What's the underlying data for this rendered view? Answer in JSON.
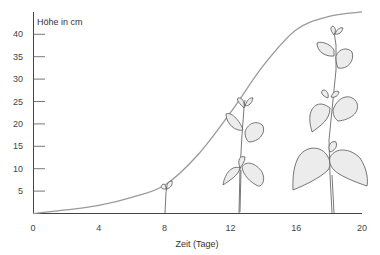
{
  "chart_data": {
    "type": "line",
    "title": "",
    "xlabel": "Zeit (Tage)",
    "ylabel": "Höhe in cm",
    "xlim": [
      0,
      20
    ],
    "ylim": [
      0,
      45
    ],
    "x_ticks": [
      0,
      4,
      8,
      12,
      16,
      20
    ],
    "y_ticks": [
      5,
      10,
      15,
      20,
      25,
      30,
      35,
      40
    ],
    "grid": false,
    "legend": null,
    "series": [
      {
        "name": "Wachstumskurve",
        "x": [
          0,
          2,
          4,
          6,
          8,
          10,
          12,
          14,
          16,
          18,
          20
        ],
        "y": [
          0,
          0.8,
          1.8,
          3.6,
          6.3,
          13,
          22.5,
          33,
          41,
          44,
          45
        ],
        "color": "#9a9a9a"
      }
    ],
    "annotations": [
      {
        "type": "illustration",
        "label": "Bohnenkeimling",
        "x": 8,
        "height_cm": 6
      },
      {
        "type": "illustration",
        "label": "Bohnenpflanze",
        "x": 12,
        "height_cm": 26
      },
      {
        "type": "illustration",
        "label": "Bohnenpflanze",
        "x": 18,
        "height_cm": 40
      }
    ]
  },
  "colors": {
    "axis": "#444444",
    "curve": "#9a9a9a",
    "plant_stroke": "#555555",
    "leaf_fill": "#eeeeee"
  }
}
